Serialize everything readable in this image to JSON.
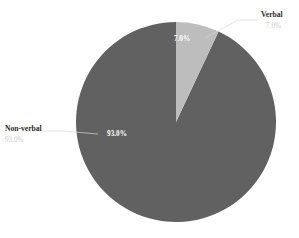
{
  "chart_data": {
    "type": "pie",
    "title": "",
    "subtitle": "",
    "xlabel": "",
    "ylabel": "",
    "legend_position": "none",
    "grid": false,
    "categories": [
      "Verbal",
      "Non-verbal"
    ],
    "values": [
      7.0,
      93.0
    ],
    "slices": [
      {
        "label": "Verbal",
        "value": 7.0,
        "percent_text": "7.0%",
        "color": "#bdbdbd",
        "inner_label": "7.0%",
        "outer_label": "Verbal",
        "outer_percent": "7.0%"
      },
      {
        "label": "Non-verbal",
        "value": 93.0,
        "percent_text": "93.0%",
        "color": "#616161",
        "inner_label": "93.0%",
        "outer_label": "Non-verbal",
        "outer_percent": "93.0%"
      }
    ],
    "start_angle_deg": 0,
    "direction": "clockwise",
    "units": "percent",
    "total": 100.0
  },
  "colors": {
    "background": "#ffffff",
    "verbal_slice": "#bdbdbd",
    "nonverbal_slice": "#616161",
    "inner_label_text": "#ffffff",
    "outer_label_text": "#2b2b2b",
    "outer_percent_text": "#c9c9c9",
    "leader_line": "#d8d8d8"
  }
}
